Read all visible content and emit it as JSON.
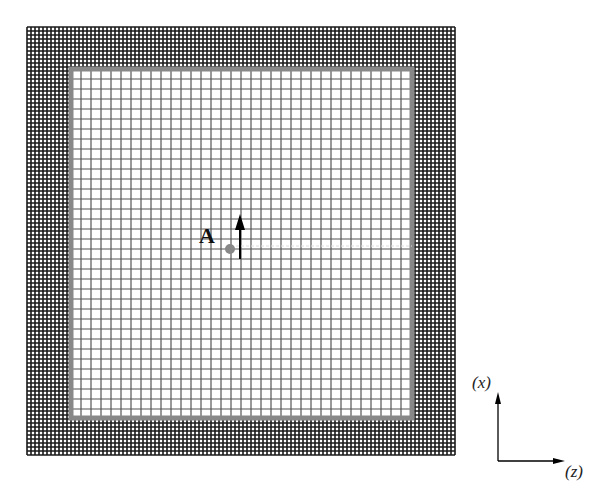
{
  "diagram": {
    "source_label": "A",
    "axis_vertical_label": "(x)",
    "axis_horizontal_label": "(z)",
    "outer_region": {
      "x0": 27,
      "y0": 27,
      "x1": 455,
      "y1": 455,
      "spacing": 4,
      "color": "#1a1a1a"
    },
    "inner_region": {
      "x0": 71,
      "y0": 69,
      "x1": 412,
      "y1": 418,
      "spacing": 10,
      "color": "#555555",
      "border_color": "#888888"
    },
    "source_point": {
      "x": 230,
      "y": 249,
      "color": "#888888"
    },
    "arrow": {
      "x": 240,
      "y_top": 214,
      "y_bottom": 259
    }
  }
}
